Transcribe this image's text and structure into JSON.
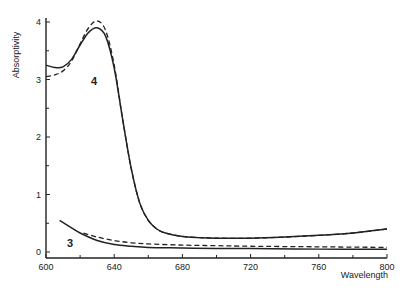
{
  "chart_data": {
    "type": "line",
    "title": "",
    "xlabel": "Wavelength",
    "ylabel": "Absorptivity",
    "xlim": [
      600,
      800
    ],
    "ylim": [
      0,
      4
    ],
    "xticks": [
      600,
      640,
      680,
      720,
      760,
      800
    ],
    "yticks": [
      0,
      1,
      2,
      3,
      4
    ],
    "grid": false,
    "legend": "none",
    "annotations": [
      {
        "text": "4",
        "x": 630,
        "y": 3.45
      },
      {
        "text": "3",
        "x": 613,
        "y": 0.15
      }
    ],
    "series": [
      {
        "name": "4 (solid)",
        "style": "solid",
        "x": [
          600,
          605,
          610,
          615,
          620,
          625,
          630,
          635,
          640,
          645,
          650,
          655,
          660,
          665,
          670,
          680,
          690,
          700,
          720,
          740,
          760,
          780,
          800
        ],
        "y": [
          3.25,
          3.21,
          3.22,
          3.35,
          3.6,
          3.82,
          3.9,
          3.75,
          3.2,
          2.3,
          1.45,
          0.85,
          0.55,
          0.4,
          0.33,
          0.27,
          0.25,
          0.24,
          0.24,
          0.26,
          0.29,
          0.33,
          0.4
        ]
      },
      {
        "name": "4 (dashed)",
        "style": "dashed",
        "x": [
          600,
          605,
          610,
          615,
          620,
          625,
          630,
          635,
          640,
          645,
          650,
          655,
          660,
          665,
          670,
          680,
          690,
          700,
          720,
          740,
          760,
          780,
          800
        ],
        "y": [
          3.05,
          3.08,
          3.15,
          3.32,
          3.62,
          3.9,
          4.02,
          3.85,
          3.25,
          2.3,
          1.45,
          0.85,
          0.55,
          0.4,
          0.33,
          0.27,
          0.25,
          0.24,
          0.24,
          0.26,
          0.29,
          0.33,
          0.4
        ]
      },
      {
        "name": "3 (solid)",
        "style": "solid",
        "x": [
          608,
          615,
          620,
          630,
          640,
          650,
          660,
          680,
          700,
          720,
          760,
          800
        ],
        "y": [
          0.55,
          0.42,
          0.33,
          0.2,
          0.13,
          0.1,
          0.08,
          0.07,
          0.06,
          0.06,
          0.05,
          0.05
        ]
      },
      {
        "name": "3 (dashed)",
        "style": "dashed",
        "x": [
          622,
          630,
          640,
          650,
          660,
          680,
          700,
          720,
          760,
          800
        ],
        "y": [
          0.33,
          0.26,
          0.2,
          0.16,
          0.14,
          0.12,
          0.11,
          0.1,
          0.09,
          0.08
        ]
      }
    ]
  }
}
